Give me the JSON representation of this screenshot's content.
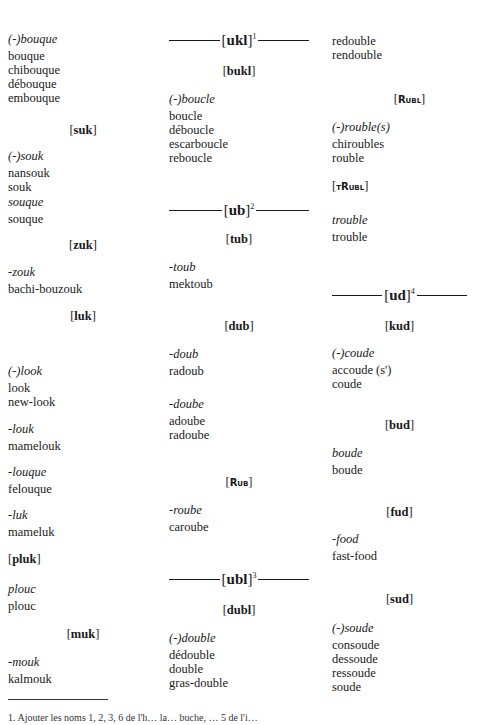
{
  "col1": {
    "g1": {
      "heading": "(-)bouque",
      "words": [
        "bouque",
        "chibouque",
        "débouque",
        "embouque"
      ]
    },
    "suk": "suk",
    "g2": {
      "heading": "(-)souk",
      "words": [
        "nansouk",
        "souk"
      ]
    },
    "g3": {
      "heading": "souque",
      "words": [
        "souque"
      ]
    },
    "zuk": "zuk",
    "g4": {
      "heading": "-zouk",
      "words": [
        "bachi-bouzouk"
      ]
    },
    "luk": "luk",
    "g5": {
      "heading": "(-)look",
      "words": [
        "look",
        "new-look"
      ]
    },
    "g6": {
      "heading": "-louk",
      "words": [
        "mamelouk"
      ]
    },
    "g7": {
      "heading": "-louque",
      "words": [
        "felouque"
      ]
    },
    "g8": {
      "heading": "-luk",
      "words": [
        "mameluk"
      ]
    },
    "pluk": "pluk",
    "g9": {
      "heading": "plouc",
      "words": [
        "plouc"
      ]
    },
    "muk": "muk",
    "g10": {
      "heading": "-mouk",
      "words": [
        "kalmouk"
      ]
    }
  },
  "col2": {
    "ukl": {
      "label": "ukl",
      "sup": "1"
    },
    "bukl": "bukl",
    "g1": {
      "heading": "(-)boucle",
      "words": [
        "boucle",
        "déboucle",
        "escarboucle",
        "reboucle"
      ]
    },
    "ub": {
      "label": "ub",
      "sup": "2"
    },
    "tub": "tub",
    "g2": {
      "heading": "-toub",
      "words": [
        "mektoub"
      ]
    },
    "dub": "dub",
    "g3": {
      "heading": "-doub",
      "words": [
        "radoub"
      ]
    },
    "g4": {
      "heading": "-doube",
      "words": [
        "adoube",
        "radoube"
      ]
    },
    "rub": "Rub",
    "g5": {
      "heading": "-roube",
      "words": [
        "caroube"
      ]
    },
    "ubl": {
      "label": "ubl",
      "sup": "3"
    },
    "dubl": "dubl",
    "g6": {
      "heading": "(-)double",
      "words": [
        "dédouble",
        "double",
        "gras-double"
      ]
    }
  },
  "col3": {
    "g0": {
      "words": [
        "redouble",
        "rendouble"
      ]
    },
    "rubl": "Rubl",
    "g1": {
      "heading": "(-)rouble(s)",
      "words": [
        "chiroubles",
        "rouble"
      ]
    },
    "trubl": "tRubl",
    "g2": {
      "heading": "trouble",
      "words": [
        "trouble"
      ]
    },
    "ud": {
      "label": "ud",
      "sup": "4"
    },
    "kud": "kud",
    "g3": {
      "heading": "(-)coude",
      "words": [
        "accoude (s')",
        "coude"
      ]
    },
    "bud": "bud",
    "g4": {
      "heading": "boude",
      "words": [
        "boude"
      ]
    },
    "fud": "fud",
    "g5": {
      "heading": "-food",
      "words": [
        "fast-food"
      ]
    },
    "sud": "sud",
    "g6": {
      "heading": "(-)soude",
      "words": [
        "consoude",
        "dessoude",
        "ressoude",
        "soude"
      ]
    }
  },
  "footnote": {
    "text": "1. Ajouter les noms 1, 2, 3, 6 de l'h… la… buche, … 5 de l'i…"
  }
}
